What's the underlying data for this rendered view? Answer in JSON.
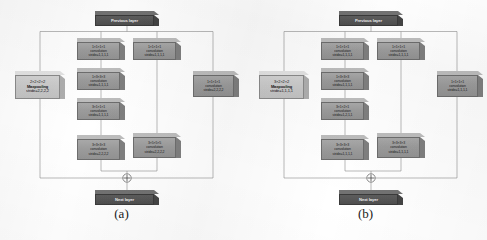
{
  "figure": {
    "type": "cnn-module-diagram",
    "panel_count": 2,
    "node_shape": "3d-box",
    "sum_symbol": "crossed-circle",
    "colors": {
      "layer_block": "#565656",
      "conv_block": "#9b9b9b",
      "pool_block": "#c9c9c9",
      "line": "#8c8c8c",
      "background": "#ffffff"
    }
  },
  "panels": [
    {
      "id": "a",
      "caption": "(a)",
      "previous_layer": "Previous layer",
      "next_layer": "Next layer",
      "pool": {
        "kernel": "2×2×2×2",
        "op": "Maxpooling",
        "stride": "stride=2,2,2,2"
      },
      "right_branch": {
        "kernel": "1×1×1×1",
        "op": "convolution",
        "stride": "stride=2,2,2,2"
      },
      "left_column": [
        {
          "kernel": "1×1×1×1",
          "op": "convolution",
          "stride": "stride=1,1,1,1"
        },
        {
          "kernel": "1×3×3×3",
          "op": "convolution",
          "stride": "stride=1,1,1,1"
        },
        {
          "kernel": "3×1×1×1",
          "op": "convolution",
          "stride": "stride=1,1,1,1"
        },
        {
          "kernel": "3×3×3×3",
          "op": "convolution",
          "stride": "stride=2,2,2,2"
        }
      ],
      "middle_column": [
        {
          "kernel": "1×1×1×1",
          "op": "convolution",
          "stride": "stride=1,1,1,1"
        },
        {
          "kernel": "3×5×5×5",
          "op": "convolution",
          "stride": "stride=2,2,2,2"
        }
      ]
    },
    {
      "id": "b",
      "caption": "(b)",
      "previous_layer": "Previous layer",
      "next_layer": "Next layer",
      "pool": {
        "kernel": "3×2×2×2",
        "op": "Maxpooling",
        "stride": "stride=1,1,1,1"
      },
      "right_branch": {
        "kernel": "1×1×1×1",
        "op": "convolution",
        "stride": "stride=1,1,1,1"
      },
      "left_column": [
        {
          "kernel": "1×1×1×1",
          "op": "convolution",
          "stride": "stride=1,1,1,1"
        },
        {
          "kernel": "1×3×3×3",
          "op": "convolution",
          "stride": "stride=1,1,1,1"
        },
        {
          "kernel": "3×1×2×1",
          "op": "convolution",
          "stride": "stride=1,2,1,1"
        },
        {
          "kernel": "3×3×3×3",
          "op": "convolution",
          "stride": "stride=1,1,1,1"
        }
      ],
      "middle_column": [
        {
          "kernel": "1×1×1×1",
          "op": "convolution",
          "stride": "stride=1,1,1,1"
        },
        {
          "kernel": "3×3×3×3",
          "op": "convolution",
          "stride": "stride=1,1,1,1"
        }
      ]
    }
  ]
}
